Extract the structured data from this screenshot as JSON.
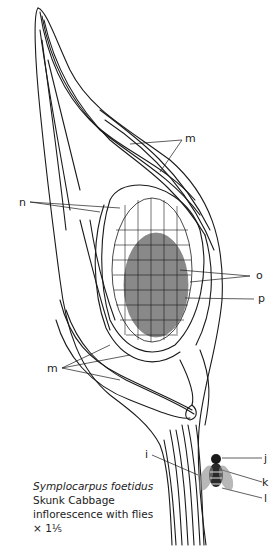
{
  "figure": {
    "subject": "Skunk Cabbage inflorescence with flies",
    "labels": {
      "m_top": "m",
      "n": "n",
      "o": "o",
      "p": "p",
      "m_bottom": "m",
      "i": "i",
      "j": "j",
      "k": "k",
      "l": "l"
    },
    "caption": {
      "scientific_name": "Symplocarpus foetidus",
      "common_name": "Skunk Cabbage",
      "description": "inflorescence with flies",
      "magnification": "× 1⅕"
    }
  }
}
